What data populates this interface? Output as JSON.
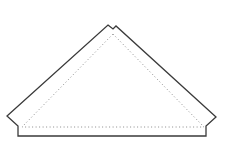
{
  "diagram": {
    "type": "quilt-pattern-piece",
    "shape": "triangle-with-seam-allowance",
    "colors": {
      "background": "#ffffff",
      "cut_line": "#3a3a3a",
      "seam_line": "#8a8a8a"
    },
    "cut_outline_points": "108,25 113,29 116,26 216,117 206,126 206,136 18,136 18,126 7,116",
    "seam_line_points": "113,34 204,127 22,127"
  }
}
